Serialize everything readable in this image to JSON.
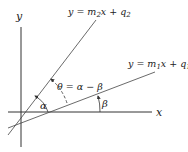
{
  "diagram": {
    "axes": {
      "x_label": "x",
      "y_label": "y"
    },
    "lines": [
      {
        "name": "line-1",
        "equation_prefix": "y = m",
        "sub_m": "1",
        "mid": "x + q",
        "sub_q": "1"
      },
      {
        "name": "line-2",
        "equation_prefix": "y = m",
        "sub_m": "2",
        "mid": "x + q",
        "sub_q": "2"
      }
    ],
    "angles": {
      "alpha": "α",
      "beta": "β",
      "theta": "θ = α − β"
    },
    "colors": {
      "stroke": "#333333",
      "background": "#ffffff"
    }
  }
}
